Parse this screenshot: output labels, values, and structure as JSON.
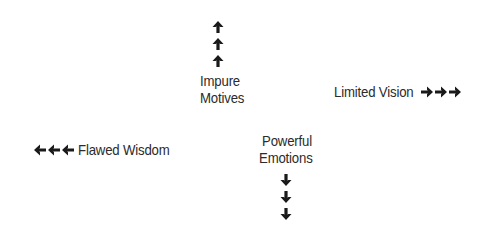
{
  "diagram": {
    "top": {
      "line1": "Impure",
      "line2": "Motives",
      "arrow_direction": "up",
      "arrow_count": 3
    },
    "right": {
      "label": "Limited Vision",
      "arrow_direction": "right",
      "arrow_count": 3
    },
    "left": {
      "label": "Flawed Wisdom",
      "arrow_direction": "left",
      "arrow_count": 3
    },
    "bottom": {
      "line1": "Powerful",
      "line2": "Emotions",
      "arrow_direction": "down",
      "arrow_count": 3
    },
    "colors": {
      "text": "#2b2b2b",
      "arrow": "#1a1a1a",
      "background": "#ffffff"
    }
  }
}
